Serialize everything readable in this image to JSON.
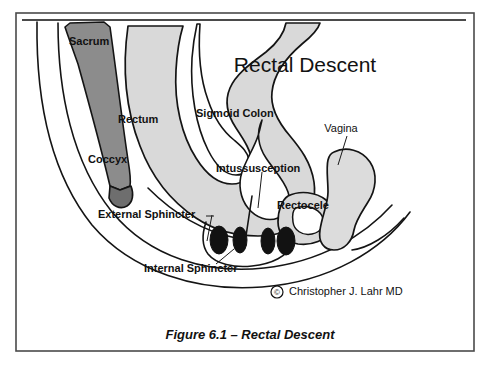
{
  "figure": {
    "title": "Rectal Descent",
    "caption": "Figure 6.1 – Rectal Descent",
    "credit": "Christopher J. Lahr MD",
    "credit_symbol": "©"
  },
  "labels": {
    "sacrum": "Sacrum",
    "rectum": "Rectum",
    "coccyx": "Coccyx",
    "sigmoid_colon": "Sigmoid Colon",
    "intussusception": "Intussusception",
    "vagina": "Vagina",
    "rectocele": "Rectocele",
    "external_sphincter": "External Sphincter",
    "internal_sphincter": "Internal Sphincter"
  },
  "colors": {
    "border": "#4a4a4a",
    "sacrum_fill": "#8c8c8c",
    "bowel_fill": "#d9d9d9",
    "vagina_fill": "#dcdcdc",
    "sphincter_fill": "#121212",
    "outline": "#141414",
    "background": "#ffffff",
    "text": "#111111"
  }
}
